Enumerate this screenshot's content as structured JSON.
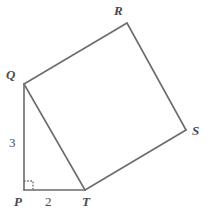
{
  "figure": {
    "type": "geometry-diagram",
    "background_color": "#ffffff",
    "stroke_color": "#6b6b70",
    "label_color": "#4a4a4f",
    "stroke_width": 1.6,
    "width": 212,
    "height": 216
  },
  "vertices": [
    {
      "name": "P",
      "label": "P",
      "x": 24,
      "y": 190
    },
    {
      "name": "Q",
      "label": "Q",
      "x": 24,
      "y": 84
    },
    {
      "name": "R",
      "label": "R",
      "x": 127,
      "y": 23
    },
    {
      "name": "S",
      "label": "S",
      "x": 186,
      "y": 130
    },
    {
      "name": "T",
      "label": "T",
      "x": 85,
      "y": 190
    }
  ],
  "edges": [
    {
      "name": "edge-PQ",
      "from": "P",
      "to": "Q"
    },
    {
      "name": "edge-QR",
      "from": "Q",
      "to": "R"
    },
    {
      "name": "edge-RS",
      "from": "R",
      "to": "S"
    },
    {
      "name": "edge-ST",
      "from": "S",
      "to": "T"
    },
    {
      "name": "edge-TP",
      "from": "T",
      "to": "P"
    },
    {
      "name": "edge-QT",
      "from": "Q",
      "to": "T"
    }
  ],
  "side_labels": {
    "pq": "3",
    "pt": "2"
  },
  "angle_marks": [
    {
      "name": "right-angle-at-P",
      "vertex": "P",
      "type": "right-angle",
      "style": "dotted-square",
      "size": 9
    }
  ]
}
